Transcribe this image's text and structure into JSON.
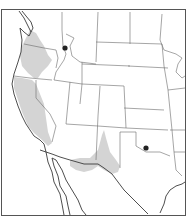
{
  "map": {
    "region": "Western United States and northern Mexico",
    "type": "species range map",
    "range_fill_color": "#d4d4d4",
    "line_color": "#555555",
    "marker_color": "#222222",
    "shaded_ranges": [
      "Pacific Northwest coast (Washington / Oregon)",
      "California coast and Central Valley",
      "Southern Arizona / New Mexico / West Texas"
    ],
    "point_records": [
      {
        "label": "Northern Idaho",
        "x": 65,
        "y": 48
      },
      {
        "label": "Central Oklahoma",
        "x": 146,
        "y": 148
      }
    ]
  }
}
